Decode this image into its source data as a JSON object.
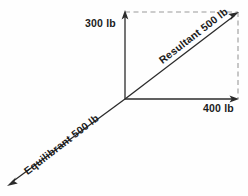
{
  "diagram": {
    "background_color": "#fefefe",
    "stroke_color": "#2b2b2b",
    "dash_color": "#9a9a9a",
    "origin": {
      "x": 125,
      "y": 99
    },
    "labels": {
      "vertical_component": "300 lb",
      "horizontal_component": "400 lb",
      "resultant": "Resultant 500 lb",
      "equilibrant": "Equilibrant 500 lb"
    },
    "vectors": [
      {
        "name": "vertical-component-vector",
        "label": "300 lb",
        "magnitude": 300,
        "unit": "lb",
        "style": "solid",
        "from": {
          "x": 125,
          "y": 99
        },
        "to": {
          "x": 125,
          "y": 12
        }
      },
      {
        "name": "horizontal-component-vector",
        "label": "400 lb",
        "magnitude": 400,
        "unit": "lb",
        "style": "solid",
        "from": {
          "x": 125,
          "y": 99
        },
        "to": {
          "x": 238,
          "y": 99
        }
      },
      {
        "name": "resultant-vector",
        "label": "Resultant 500 lb",
        "magnitude": 500,
        "unit": "lb",
        "style": "solid",
        "from": {
          "x": 125,
          "y": 99
        },
        "to": {
          "x": 238,
          "y": 12
        }
      },
      {
        "name": "equilibrant-vector",
        "label": "Equilibrant 500 lb",
        "magnitude": 500,
        "unit": "lb",
        "style": "solid",
        "from": {
          "x": 125,
          "y": 99
        },
        "to": {
          "x": 8,
          "y": 185
        }
      }
    ],
    "construction_lines": [
      {
        "name": "dashed-top-line",
        "style": "dashed",
        "from": {
          "x": 125,
          "y": 12
        },
        "to": {
          "x": 238,
          "y": 12
        }
      },
      {
        "name": "dashed-right-line",
        "style": "dashed",
        "from": {
          "x": 238,
          "y": 12
        },
        "to": {
          "x": 238,
          "y": 99
        }
      }
    ]
  }
}
